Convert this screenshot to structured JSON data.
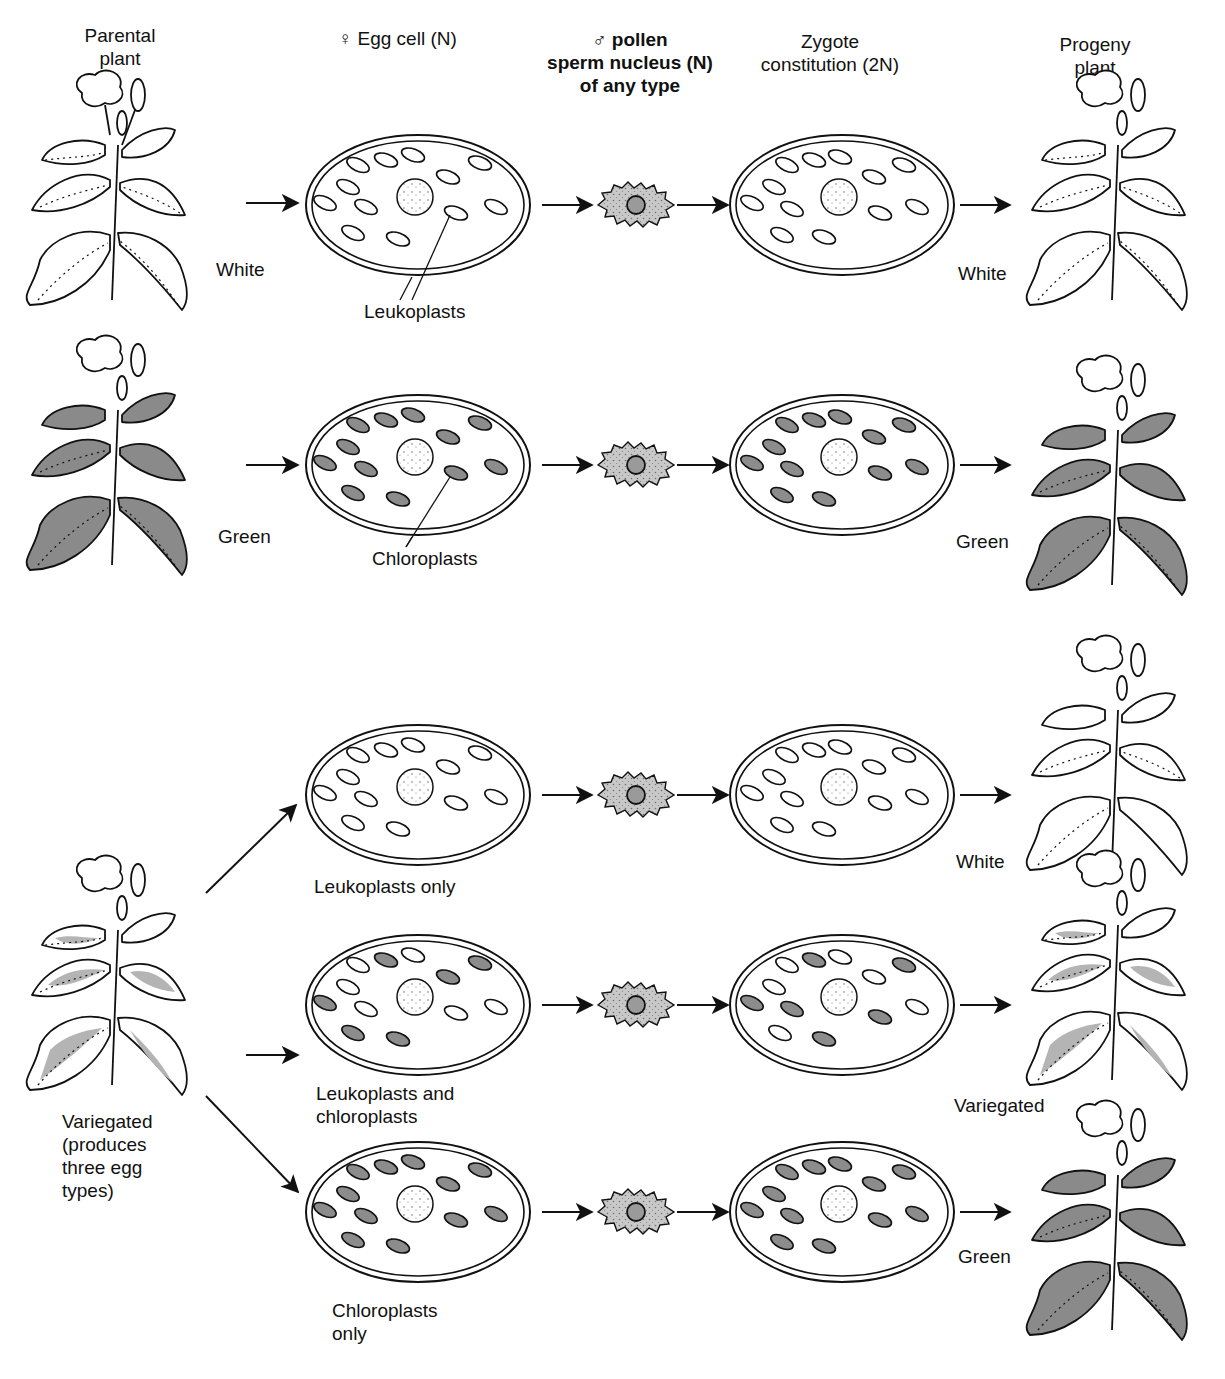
{
  "headers": {
    "parental": "Parental\nplant",
    "egg": "♀ Egg cell (N)",
    "pollen": "♂ pollen\nsperm nucleus (N)\nof any type",
    "zygote": "Zygote\nconstitution (2N)",
    "progeny": "Progeny\nplant"
  },
  "rows": [
    {
      "parent_label": "White",
      "plastid_label": "Leukoplasts",
      "progeny_label": "White"
    },
    {
      "parent_label": "Green",
      "plastid_label": "Chloroplasts",
      "progeny_label": "Green"
    }
  ],
  "variegated": {
    "parent_label": "Variegated\n(produces\nthree egg\ntypes)",
    "egg_types": [
      {
        "label": "Leukoplasts only",
        "progeny_label": "White"
      },
      {
        "label": "Leukoplasts and\nchloroplasts",
        "progeny_label": "Variegated"
      },
      {
        "label": "Chloroplasts\nonly",
        "progeny_label": "Green"
      }
    ]
  },
  "colors": {
    "chloroplast": "#8c8c8c",
    "leukoplast": "#ffffff",
    "pollen": "#c8c8c8",
    "green_leaf": "#8a8a8a",
    "variegated_patch": "#b4b4b4",
    "line": "#111111"
  }
}
